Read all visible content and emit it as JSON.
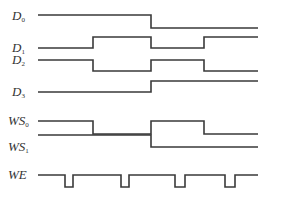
{
  "diagram": {
    "type": "timing-diagram",
    "stroke_color": "#3a3a3a",
    "x_start": 38,
    "x_end": 258,
    "signals": [
      {
        "name": "D",
        "sub": "0",
        "label_y": 10,
        "high": 15,
        "low": 28,
        "points": [
          [
            38,
            "H"
          ],
          [
            151,
            "H"
          ],
          [
            151,
            "L"
          ],
          [
            258,
            "L"
          ]
        ]
      },
      {
        "name": "D",
        "sub": "1",
        "label_y": 42,
        "high": 37,
        "low": 48,
        "points": [
          [
            38,
            "L"
          ],
          [
            93,
            "L"
          ],
          [
            93,
            "H"
          ],
          [
            151,
            "H"
          ],
          [
            151,
            "L"
          ],
          [
            204,
            "L"
          ],
          [
            204,
            "H"
          ],
          [
            258,
            "H"
          ]
        ]
      },
      {
        "name": "D",
        "sub": "2",
        "label_y": 54,
        "high": 60,
        "low": 71,
        "points": [
          [
            38,
            "H"
          ],
          [
            93,
            "H"
          ],
          [
            93,
            "L"
          ],
          [
            151,
            "L"
          ],
          [
            151,
            "H"
          ],
          [
            204,
            "H"
          ],
          [
            204,
            "L"
          ],
          [
            258,
            "L"
          ]
        ]
      },
      {
        "name": "D",
        "sub": "3",
        "label_y": 86,
        "high": 81,
        "low": 92,
        "points": [
          [
            38,
            "L"
          ],
          [
            151,
            "L"
          ],
          [
            151,
            "H"
          ],
          [
            258,
            "H"
          ]
        ]
      },
      {
        "name": "WS",
        "sub": "0",
        "label_y": 115,
        "high": 121,
        "low": 134,
        "points": [
          [
            38,
            "H"
          ],
          [
            93,
            "H"
          ],
          [
            93,
            "L"
          ],
          [
            151,
            "L"
          ],
          [
            151,
            "H"
          ],
          [
            204,
            "H"
          ],
          [
            204,
            "L"
          ],
          [
            258,
            "L"
          ]
        ]
      },
      {
        "name": "WS",
        "sub": "1",
        "label_y": 141,
        "high": 135,
        "low": 147,
        "points": [
          [
            38,
            "H"
          ],
          [
            151,
            "H"
          ],
          [
            151,
            "L"
          ],
          [
            258,
            "L"
          ]
        ]
      },
      {
        "name": "WE",
        "sub": "",
        "label_y": 169,
        "high": 175,
        "low": 187,
        "points": [
          [
            38,
            "H"
          ],
          [
            65,
            "H"
          ],
          [
            65,
            "L"
          ],
          [
            73,
            "L"
          ],
          [
            73,
            "H"
          ],
          [
            121,
            "H"
          ],
          [
            121,
            "L"
          ],
          [
            129,
            "L"
          ],
          [
            129,
            "H"
          ],
          [
            175,
            "H"
          ],
          [
            175,
            "L"
          ],
          [
            185,
            "L"
          ],
          [
            185,
            "H"
          ],
          [
            225,
            "H"
          ],
          [
            225,
            "L"
          ],
          [
            235,
            "L"
          ],
          [
            235,
            "H"
          ],
          [
            258,
            "H"
          ]
        ]
      }
    ]
  },
  "labels": {
    "d0": "D",
    "d0_sub": "0",
    "d1": "D",
    "d1_sub": "1",
    "d2": "D",
    "d2_sub": "2",
    "d3": "D",
    "d3_sub": "3",
    "ws0": "WS",
    "ws0_sub": "0",
    "ws1": "WS",
    "ws1_sub": "1",
    "we": "WE"
  }
}
